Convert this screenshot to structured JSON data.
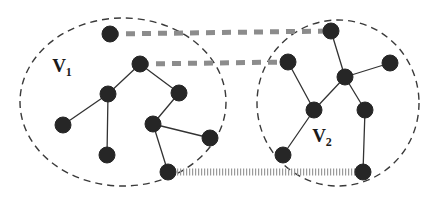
{
  "figure": {
    "width": 439,
    "height": 202,
    "background_color": "#ffffff"
  },
  "style": {
    "node_color": "#262626",
    "node_radius": 8,
    "edge_color": "#333333",
    "edge_width": 1.3,
    "cluster_border_color": "#3a3a3a",
    "cluster_border_dash": "7,5",
    "cut_edge_color": "#8c8c8c",
    "cut_edge_width": 5,
    "cut_edge_dash": "9,7",
    "hatched_line_color": "#9a9a9a",
    "label_color": "#1a1a1a"
  },
  "clusters": [
    {
      "id": "V1",
      "label": "V",
      "subscript": "1",
      "label_x": 62,
      "label_y": 72,
      "ellipse": {
        "cx": 123,
        "cy": 102,
        "rx": 103,
        "ry": 84
      }
    },
    {
      "id": "V2",
      "label": "V",
      "subscript": "2",
      "label_x": 322,
      "label_y": 142,
      "ellipse": {
        "cx": 338,
        "cy": 103,
        "rx": 81,
        "ry": 83
      }
    }
  ],
  "nodes": [
    {
      "id": "a1",
      "cluster": "V1",
      "x": 110,
      "y": 34
    },
    {
      "id": "a2",
      "cluster": "V1",
      "x": 140,
      "y": 64
    },
    {
      "id": "a3",
      "cluster": "V1",
      "x": 108,
      "y": 94
    },
    {
      "id": "a4",
      "cluster": "V1",
      "x": 63,
      "y": 125
    },
    {
      "id": "a5",
      "cluster": "V1",
      "x": 107,
      "y": 155
    },
    {
      "id": "a6",
      "cluster": "V1",
      "x": 179,
      "y": 93
    },
    {
      "id": "a7",
      "cluster": "V1",
      "x": 153,
      "y": 124
    },
    {
      "id": "a8",
      "cluster": "V1",
      "x": 210,
      "y": 138
    },
    {
      "id": "a9",
      "cluster": "V1",
      "x": 168,
      "y": 172
    },
    {
      "id": "b1",
      "cluster": "V2",
      "x": 331,
      "y": 31
    },
    {
      "id": "b2",
      "cluster": "V2",
      "x": 288,
      "y": 62
    },
    {
      "id": "b3",
      "cluster": "V2",
      "x": 345,
      "y": 77
    },
    {
      "id": "b4",
      "cluster": "V2",
      "x": 390,
      "y": 63
    },
    {
      "id": "b5",
      "cluster": "V2",
      "x": 314,
      "y": 110
    },
    {
      "id": "b6",
      "cluster": "V2",
      "x": 365,
      "y": 110
    },
    {
      "id": "b7",
      "cluster": "V2",
      "x": 283,
      "y": 155
    },
    {
      "id": "b8",
      "cluster": "V2",
      "x": 363,
      "y": 172
    }
  ],
  "edges": [
    {
      "from": "a2",
      "to": "a3"
    },
    {
      "from": "a2",
      "to": "a6"
    },
    {
      "from": "a3",
      "to": "a4"
    },
    {
      "from": "a3",
      "to": "a5"
    },
    {
      "from": "a6",
      "to": "a7"
    },
    {
      "from": "a7",
      "to": "a8"
    },
    {
      "from": "a7",
      "to": "a9"
    },
    {
      "from": "b1",
      "to": "b3"
    },
    {
      "from": "b2",
      "to": "b5"
    },
    {
      "from": "b3",
      "to": "b4"
    },
    {
      "from": "b3",
      "to": "b5"
    },
    {
      "from": "b3",
      "to": "b6"
    },
    {
      "from": "b5",
      "to": "b7"
    },
    {
      "from": "b6",
      "to": "b8"
    }
  ],
  "cut_edges": [
    {
      "id": "cut-top",
      "from": "a1",
      "to": "b1",
      "style": "thick-dashed"
    },
    {
      "id": "cut-middle",
      "from": "a2",
      "to": "b2",
      "style": "thick-dashed"
    },
    {
      "id": "cut-bottom",
      "from": "a9",
      "to": "b8",
      "style": "hatched"
    }
  ]
}
